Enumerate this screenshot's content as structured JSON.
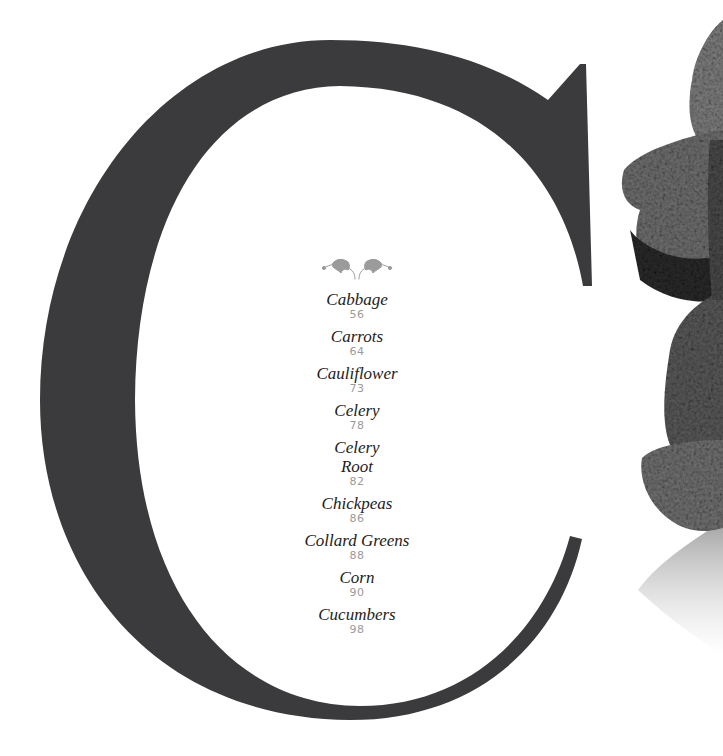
{
  "section": {
    "letter": "C",
    "letter_color": "#3b3b3d",
    "ornament": "leaf-flourish-icon",
    "ornament_color": "#9b9b9b",
    "title_color": "#1c1c1c",
    "page_color": "#9a9a9a"
  },
  "entries": [
    {
      "title": "Cabbage",
      "page": "56"
    },
    {
      "title": "Carrots",
      "page": "64"
    },
    {
      "title": "Cauliflower",
      "page": "73"
    },
    {
      "title": "Celery",
      "page": "78"
    },
    {
      "title": "Celery\nRoot",
      "title_lines": [
        "Celery",
        "Root"
      ],
      "page": "82"
    },
    {
      "title": "Chickpeas",
      "page": "86"
    },
    {
      "title": "Collard Greens",
      "page": "88"
    },
    {
      "title": "Corn",
      "page": "90"
    },
    {
      "title": "Cucumbers",
      "page": "98"
    }
  ],
  "illustration": {
    "subject": "cabbage-illustration"
  }
}
